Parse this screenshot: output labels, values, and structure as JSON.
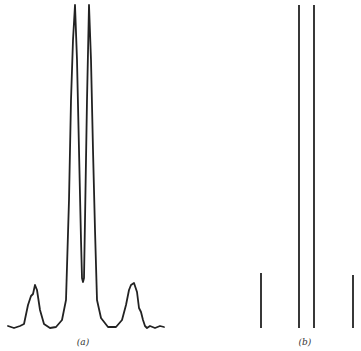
{
  "figure": {
    "background": "#ffffff",
    "stroke_color": "#222222",
    "panels": [
      {
        "id": "a",
        "label": "(a)",
        "label_pos": [
          83,
          337
        ],
        "type": "continuous-spectrum",
        "baseline_y": 328,
        "description": "Measured spectrum with two tall central peaks, a deep dip between them, and two smaller side peaks"
      },
      {
        "id": "b",
        "label": "(b)",
        "label_pos": [
          305,
          337
        ],
        "type": "stick-spectrum",
        "baseline_y": 328,
        "sticks": [
          {
            "x": 261,
            "top": 273
          },
          {
            "x": 299,
            "top": 5
          },
          {
            "x": 314,
            "top": 5
          },
          {
            "x": 353,
            "top": 275
          }
        ]
      }
    ]
  },
  "chart_data": [
    {
      "type": "line",
      "title": "(a)",
      "xlabel": "",
      "ylabel": "",
      "grid": false,
      "series": [
        {
          "name": "spectrum (a)",
          "x": [
            8,
            14,
            20,
            24,
            28,
            31,
            33,
            35,
            37,
            40,
            44,
            50,
            56,
            62,
            66,
            69,
            71,
            73,
            75,
            77,
            79,
            81,
            82,
            83,
            84,
            85,
            87,
            89,
            91,
            93,
            95,
            97,
            101,
            108,
            116,
            122,
            126,
            129,
            131,
            134,
            137,
            139,
            141,
            143,
            145,
            147,
            150,
            155,
            160,
            164
          ],
          "y_px": [
            326,
            328,
            326,
            324,
            305,
            296,
            294,
            285,
            290,
            310,
            324,
            328,
            327,
            320,
            300,
            200,
            100,
            40,
            5,
            60,
            150,
            240,
            278,
            282,
            278,
            220,
            100,
            5,
            60,
            150,
            230,
            300,
            318,
            327,
            327,
            320,
            305,
            290,
            285,
            283,
            292,
            308,
            312,
            320,
            326,
            328,
            326,
            328,
            326,
            327
          ]
        }
      ]
    },
    {
      "type": "bar",
      "title": "(b)",
      "xlabel": "",
      "ylabel": "",
      "grid": false,
      "categories": [
        "line 1",
        "line 2",
        "line 3",
        "line 4"
      ],
      "x_px": [
        261,
        299,
        314,
        353
      ],
      "values": [
        0.17,
        1.0,
        1.0,
        0.16
      ]
    }
  ]
}
